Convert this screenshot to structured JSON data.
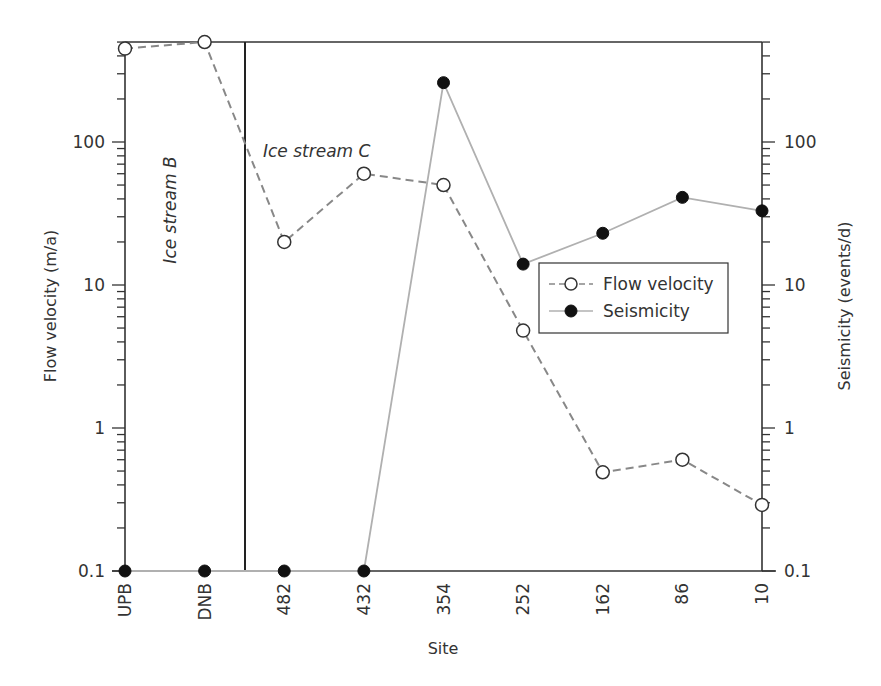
{
  "chart_data": {
    "type": "line",
    "title": "",
    "xlabel": "Site",
    "ylabel": "Flow velocity (m/a)",
    "ylabel_right": "Seismicity (events/d)",
    "yscale": "log",
    "ylim": [
      0.1,
      500
    ],
    "y_right_scale": "log",
    "y_right_lim": [
      0.1,
      500
    ],
    "grid": false,
    "categories": [
      "UPB",
      "DNB",
      "482",
      "432",
      "354",
      "252",
      "162",
      "86",
      "10"
    ],
    "y_ticks": [
      "0.1",
      "1",
      "10",
      "100"
    ],
    "y_right_ticks": [
      "0.1",
      "1",
      "10",
      "100"
    ],
    "series": [
      {
        "name": "Flow velocity",
        "style": "dashed",
        "marker": "open-circle",
        "color": "#888888",
        "values": [
          450,
          500,
          20,
          60,
          50,
          4.8,
          0.49,
          0.6,
          0.29
        ]
      },
      {
        "name": "Seismicity",
        "style": "solid",
        "marker": "filled-circle",
        "color": "#b0b0b0",
        "values": [
          0.1,
          0.1,
          0.1,
          0.1,
          260,
          14,
          23,
          41,
          33
        ]
      }
    ],
    "annotations": [
      {
        "text": "Ice stream B",
        "orientation": "vertical",
        "region": [
          "UPB",
          "DNB"
        ]
      },
      {
        "text": "Ice stream C",
        "orientation": "horizontal",
        "region": [
          "482",
          "10"
        ]
      }
    ],
    "divider_between": [
      "DNB",
      "482"
    ],
    "legend": {
      "position": "center-right",
      "entries": [
        "Flow velocity",
        "Seismicity"
      ]
    }
  },
  "labels": {
    "xlabel": "Site",
    "ylabel_left": "Flow velocity (m/a)",
    "ylabel_right": "Seismicity (events/d)",
    "region_b": "Ice stream B",
    "region_c": "Ice stream C",
    "legend_flow": "Flow velocity",
    "legend_seis": "Seismicity"
  }
}
